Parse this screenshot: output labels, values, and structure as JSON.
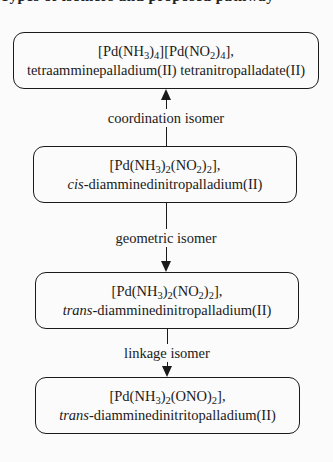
{
  "header_fragment": "Types of isomers and proposed pathway",
  "nodes": [
    {
      "formula_parts": [
        "[Pd(NH",
        "3",
        ")",
        "4",
        "][Pd(NO",
        "2",
        ")",
        "4",
        "],"
      ],
      "name_prefix": "",
      "name_rest": "tetraamminepalladium(II) tetranitropalladate(II)"
    },
    {
      "formula_parts": [
        "[Pd(NH",
        "3",
        ")",
        "2",
        "(NO",
        "2",
        ")",
        "2",
        "],"
      ],
      "name_prefix": "cis",
      "name_rest": "-diamminedinitropalladium(II)"
    },
    {
      "formula_parts": [
        "[Pd(NH",
        "3",
        ")",
        "2",
        "(NO",
        "2",
        ")",
        "2",
        "],"
      ],
      "name_prefix": "trans",
      "name_rest": "-diamminedinitropalladium(II)"
    },
    {
      "formula_parts": [
        "[Pd(NH",
        "3",
        ")",
        "2",
        "(ONO)",
        "2",
        "],",
        "",
        ""
      ],
      "name_prefix": "trans",
      "name_rest": "-diamminedinitritopalladium(II)"
    }
  ],
  "edges": [
    {
      "from": 1,
      "to": 0,
      "label": "coordination isomer",
      "direction": "up"
    },
    {
      "from": 1,
      "to": 2,
      "label": "geometric isomer",
      "direction": "down"
    },
    {
      "from": 2,
      "to": 3,
      "label": "linkage isomer",
      "direction": "down"
    }
  ]
}
